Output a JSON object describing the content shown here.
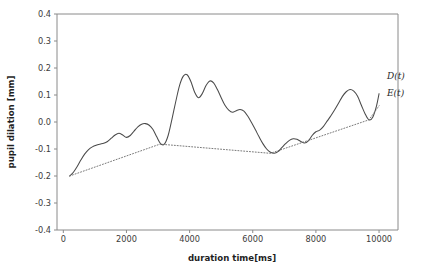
{
  "chart_data": {
    "type": "line",
    "title": "",
    "xlabel": "duration time[ms]",
    "ylabel": "pupil dilation [mm]",
    "xlim": [
      -200,
      10600
    ],
    "ylim": [
      -0.4,
      0.4
    ],
    "xticks": [
      0,
      2000,
      4000,
      6000,
      8000,
      10000
    ],
    "xticklabels": [
      "0",
      "2000",
      "4000",
      "6000",
      "8000",
      "10000"
    ],
    "yticks": [
      -0.4,
      -0.3,
      -0.2,
      -0.1,
      0.0,
      0.1,
      0.2,
      0.3,
      0.4
    ],
    "yticklabels": [
      "-0.4",
      "-0.3",
      "-0.2",
      "-0.1",
      "0.0",
      "0.1",
      "0.2",
      "0.3",
      "0.4"
    ],
    "grid": false,
    "legend_position": "inline-annotation",
    "series": [
      {
        "name": "D(t)",
        "style": "solid",
        "color": "#4a4a4a",
        "annotation": "D(t)",
        "annotation_x": 10250,
        "annotation_y": 0.16,
        "x": [
          200,
          320,
          440,
          560,
          680,
          800,
          920,
          1040,
          1160,
          1280,
          1400,
          1520,
          1640,
          1760,
          1880,
          2000,
          2120,
          2240,
          2360,
          2480,
          2600,
          2720,
          2840,
          2960,
          3080,
          3200,
          3320,
          3440,
          3560,
          3680,
          3800,
          3920,
          4040,
          4160,
          4280,
          4400,
          4520,
          4640,
          4760,
          4880,
          5000,
          5120,
          5240,
          5360,
          5480,
          5600,
          5720,
          5840,
          5960,
          6080,
          6200,
          6320,
          6440,
          6560,
          6680,
          6800,
          6920,
          7040,
          7160,
          7280,
          7400,
          7520,
          7640,
          7760,
          7880,
          8000,
          8120,
          8240,
          8360,
          8480,
          8600,
          8720,
          8840,
          8960,
          9080,
          9200,
          9320,
          9440,
          9560,
          9680,
          9800,
          9920,
          10000
        ],
        "y": [
          -0.2,
          -0.186,
          -0.165,
          -0.14,
          -0.118,
          -0.102,
          -0.092,
          -0.086,
          -0.082,
          -0.079,
          -0.072,
          -0.06,
          -0.048,
          -0.042,
          -0.048,
          -0.057,
          -0.05,
          -0.034,
          -0.018,
          -0.008,
          -0.006,
          -0.012,
          -0.028,
          -0.055,
          -0.08,
          -0.082,
          -0.05,
          0.01,
          0.075,
          0.135,
          0.17,
          0.175,
          0.15,
          0.11,
          0.09,
          0.105,
          0.135,
          0.152,
          0.145,
          0.12,
          0.09,
          0.062,
          0.044,
          0.036,
          0.042,
          0.046,
          0.04,
          0.022,
          -0.002,
          -0.028,
          -0.055,
          -0.08,
          -0.1,
          -0.112,
          -0.116,
          -0.11,
          -0.095,
          -0.08,
          -0.068,
          -0.062,
          -0.064,
          -0.072,
          -0.078,
          -0.07,
          -0.05,
          -0.036,
          -0.03,
          -0.016,
          0.004,
          0.024,
          0.046,
          0.07,
          0.095,
          0.112,
          0.12,
          0.114,
          0.095,
          0.062,
          0.03,
          0.008,
          0.018,
          0.06,
          0.105
        ]
      },
      {
        "name": "E(t)",
        "style": "dotted",
        "color": "#6a6a6a",
        "annotation": "E(t)",
        "annotation_x": 10250,
        "annotation_y": 0.098,
        "x": [
          200,
          3060,
          6560,
          9680,
          10000
        ],
        "y": [
          -0.2,
          -0.082,
          -0.116,
          0.008,
          0.06
        ]
      }
    ]
  },
  "axes": {
    "y_label": "pupil dilation [mm]",
    "x_label": "duration time[ms]"
  },
  "annotations": {
    "signal_label": "D(t)",
    "envelope_label": "E(t)"
  },
  "colors": {
    "signal": "#4a4a4a",
    "envelope": "#6a6a6a",
    "axis": "#8a8a8a",
    "text": "#1f1f1f",
    "background": "#ffffff"
  }
}
